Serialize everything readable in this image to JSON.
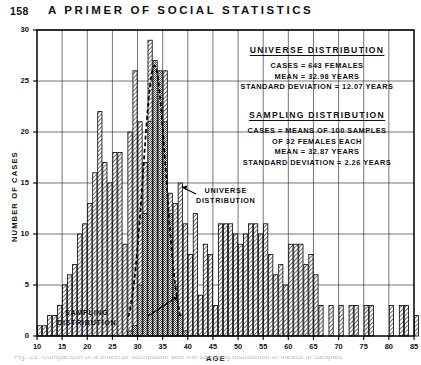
{
  "running_head": {
    "page_number": "158",
    "title": "A PRIMER OF SOCIAL STATISTICS"
  },
  "annotations": {
    "universe": {
      "title": "UNIVERSE  DISTRIBUTION",
      "lines": [
        "CASES = 643 FEMALES",
        "MEAN = 32.98 YEARS",
        "STANDARD  DEVIATION = 12.07 YEARS"
      ]
    },
    "sampling": {
      "title": "SAMPLING  DISTRIBUTION",
      "lines": [
        "CASES = MEANS OF 100  SAMPLES",
        "OF 32 FEMALES EACH",
        "MEAN = 32.87  YEARS",
        "STANDARD  DEVIATION = 2.26 YEARS"
      ]
    },
    "callout_universe": [
      "UNIVERSE",
      "DISTRIBUTION"
    ],
    "callout_sampling": [
      "SAMPLING",
      "DISTRIBUTION"
    ]
  },
  "caption": {
    "text": "Fig. 33.  Comparison of a universe distribution with the sampling distribution of means of samples"
  },
  "chart_data": {
    "type": "bar",
    "title": "",
    "xlabel": "AGE",
    "ylabel": "NUMBER OF CASES",
    "xlim": [
      10,
      85
    ],
    "ylim": [
      0,
      30
    ],
    "xticks": [
      10,
      15,
      20,
      25,
      30,
      35,
      40,
      45,
      50,
      55,
      60,
      65,
      70,
      75,
      80,
      85
    ],
    "yticks": [
      0,
      5,
      10,
      15,
      20,
      25,
      30
    ],
    "grid": true,
    "bar_width_years": 1,
    "series": [
      {
        "name": "UNIVERSE DISTRIBUTION",
        "style": "hatched",
        "color": "#000000",
        "x": [
          10,
          11,
          12,
          13,
          14,
          15,
          16,
          17,
          18,
          19,
          20,
          21,
          22,
          23,
          24,
          25,
          26,
          27,
          28,
          29,
          30,
          31,
          32,
          33,
          34,
          35,
          36,
          37,
          38,
          39,
          40,
          41,
          42,
          43,
          44,
          45,
          46,
          47,
          48,
          49,
          50,
          51,
          52,
          53,
          54,
          55,
          56,
          57,
          58,
          59,
          60,
          61,
          62,
          63,
          64,
          65,
          66,
          67,
          68,
          69,
          70,
          71,
          72,
          73,
          74,
          75,
          76,
          77,
          78,
          79,
          80,
          81,
          82,
          83,
          84,
          85
        ],
        "values": [
          1,
          1,
          2,
          2,
          3,
          5,
          6,
          7,
          10,
          11,
          13,
          16,
          22,
          17,
          15,
          18,
          18,
          9,
          20,
          26,
          21,
          17,
          29,
          23,
          22,
          26,
          14,
          13,
          15,
          11,
          8,
          12,
          4,
          9,
          8,
          3,
          11,
          11,
          11,
          10,
          9,
          10,
          11,
          11,
          10,
          11,
          8,
          6,
          7,
          5,
          9,
          9,
          9,
          7,
          8,
          6,
          3,
          0,
          3,
          0,
          3,
          0,
          3,
          3,
          0,
          3,
          3,
          0,
          0,
          0,
          3,
          0,
          3,
          3,
          0,
          2
        ]
      },
      {
        "name": "SAMPLING DISTRIBUTION",
        "style": "shaded",
        "color": "#8c8c8c",
        "x": [
          28,
          29,
          30,
          31,
          32,
          33,
          34,
          35,
          36,
          37,
          38,
          39
        ],
        "values": [
          0.5,
          1,
          5,
          12,
          21,
          27,
          26,
          21,
          12,
          5,
          2,
          0.5
        ]
      }
    ],
    "overlay_curve": {
      "name": "normal-curve",
      "style": "dashed",
      "mean": 32.87,
      "sd": 2.26,
      "peak_value": 26.5
    }
  }
}
